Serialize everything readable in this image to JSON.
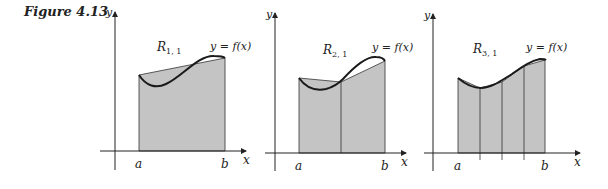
{
  "figure": {
    "label": "Figure 4.13",
    "function_label": "y = f(x)"
  },
  "axes": {
    "x_label": "x",
    "y_label": "y",
    "a_label": "a",
    "b_label": "b"
  },
  "panels": [
    {
      "region_label": "R",
      "subscript": "1, 1",
      "subintervals": 1
    },
    {
      "region_label": "R",
      "subscript": "2, 1",
      "subintervals": 2
    },
    {
      "region_label": "R",
      "subscript": "3, 1",
      "subintervals": 4
    }
  ],
  "colors": {
    "fill": "#c4c4c4",
    "stroke": "#222222",
    "curve": "#1a1a1a"
  }
}
